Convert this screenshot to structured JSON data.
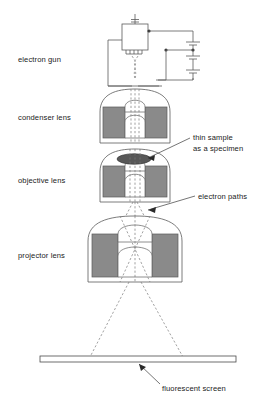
{
  "figure": {
    "background_color": "#ffffff",
    "line_color": "#5a5a5a",
    "coil_fill_color": "#8a8a8a",
    "sample_fill_color": "#585858",
    "beam_color": "#7a7a7a",
    "text_color": "#1a1a1a"
  },
  "labels": {
    "electron_gun": "electron gun",
    "condenser_lens": "condenser lens",
    "objective_lens": "objective lens",
    "projector_lens": "projector lens",
    "thin_sample_line1": "thin sample",
    "thin_sample_line2": "as a specimen",
    "electron_paths": "electron paths",
    "fluorescent_screen": "fluorescent screen"
  },
  "components": [
    {
      "name": "electron-gun",
      "label": "electron gun",
      "kind": "source"
    },
    {
      "name": "condenser-lens",
      "label": "condenser lens",
      "kind": "magnetic-lens"
    },
    {
      "name": "objective-lens",
      "label": "objective lens",
      "kind": "magnetic-lens"
    },
    {
      "name": "projector-lens",
      "label": "projector lens",
      "kind": "magnetic-lens"
    },
    {
      "name": "thin-sample",
      "label": "thin sample as a specimen",
      "kind": "specimen"
    },
    {
      "name": "electron-paths",
      "label": "electron paths",
      "kind": "beam"
    },
    {
      "name": "fluorescent-screen",
      "label": "fluorescent screen",
      "kind": "detector"
    }
  ],
  "circuit": {
    "cell_count": 3,
    "description": "high voltage supply stack wired to electron gun"
  }
}
